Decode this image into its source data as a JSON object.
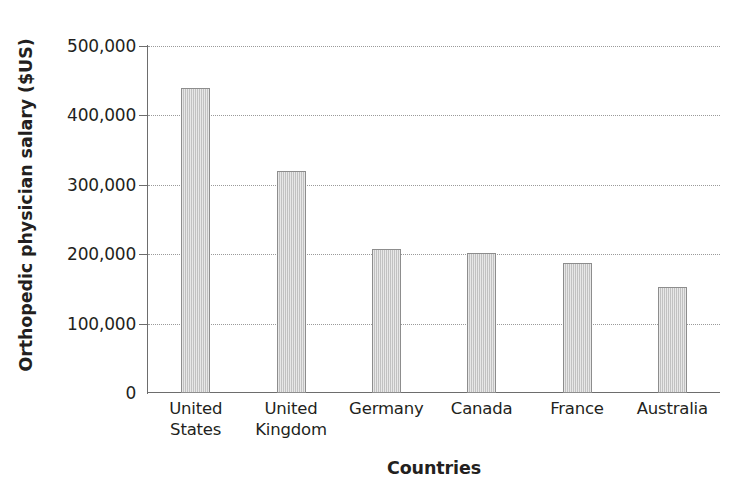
{
  "chart_data": {
    "type": "bar",
    "title": "",
    "xlabel": "Countries",
    "ylabel": "Orthopedic physician salary ($US)",
    "categories": [
      "United States",
      "United Kingdom",
      "Germany",
      "Canada",
      "France",
      "Australia"
    ],
    "category_lines": [
      [
        "United",
        "States"
      ],
      [
        "United",
        "Kingdom"
      ],
      [
        "Germany"
      ],
      [
        "Canada"
      ],
      [
        "France"
      ],
      [
        "Australia"
      ]
    ],
    "values": [
      440000,
      320000,
      208000,
      202000,
      188000,
      153000
    ],
    "ylim": [
      0,
      500000
    ],
    "ytick_values": [
      0,
      100000,
      200000,
      300000,
      400000,
      500000
    ],
    "ytick_labels": [
      "0",
      "100,000",
      "200,000",
      "300,000",
      "400,000",
      "500,000"
    ],
    "grid": true,
    "grid_axis": "y",
    "legend": "none",
    "bar_fill_color": "#cbcbcb",
    "bar_border_color": "#8d8d8d",
    "gridline_color": "#9a9a9a",
    "axis_color": "#6d6d6d",
    "text_color": "#231f20"
  }
}
